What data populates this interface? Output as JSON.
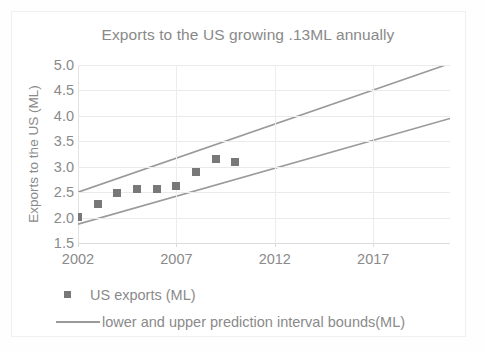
{
  "chart_data": {
    "type": "scatter",
    "title": "Exports to the US growing .13ML annually",
    "xlabel": "",
    "ylabel": "Exports to the US (ML)",
    "xlim": [
      2002,
      2020.9
    ],
    "ylim": [
      1.5,
      5.0
    ],
    "xticks": [
      "2002",
      "2007",
      "2012",
      "2017"
    ],
    "xtick_values": [
      2002,
      2007,
      2012,
      2017
    ],
    "yticks": [
      "1.5",
      "2.0",
      "2.5",
      "3.0",
      "3.5",
      "4.0",
      "4.5",
      "5.0"
    ],
    "ytick_values": [
      1.5,
      2.0,
      2.5,
      3.0,
      3.5,
      4.0,
      4.5,
      5.0
    ],
    "grid": true,
    "legend_position": "bottom-left",
    "series": [
      {
        "name": "US exports (ML)",
        "type": "scatter",
        "marker": "square",
        "color": "#787878",
        "x": [
          2002,
          2003,
          2004,
          2005,
          2006,
          2007,
          2008,
          2009,
          2010
        ],
        "values": [
          2.02,
          2.27,
          2.49,
          2.56,
          2.56,
          2.62,
          2.9,
          3.15,
          3.1
        ]
      },
      {
        "name": "upper prediction interval bound",
        "type": "line",
        "color": "#9a9a9a",
        "x": [
          2002,
          2020.9
        ],
        "values": [
          2.5,
          5.03
        ]
      },
      {
        "name": "lower prediction interval bound",
        "type": "line",
        "color": "#9a9a9a",
        "x": [
          2002,
          2020.9
        ],
        "values": [
          1.87,
          3.95
        ]
      }
    ],
    "legend": [
      {
        "label": "US exports (ML)",
        "marker": "square",
        "color": "#787878"
      },
      {
        "label": "lower and upper prediction interval bounds(ML)",
        "marker": "line",
        "color": "#9a9a9a"
      }
    ],
    "annotations": [],
    "colors": {
      "marker": "#787878",
      "bounds_line": "#9a9a9a",
      "text": "#8a8a8a",
      "grid": "#eaeaea",
      "background": "#ffffff"
    }
  }
}
